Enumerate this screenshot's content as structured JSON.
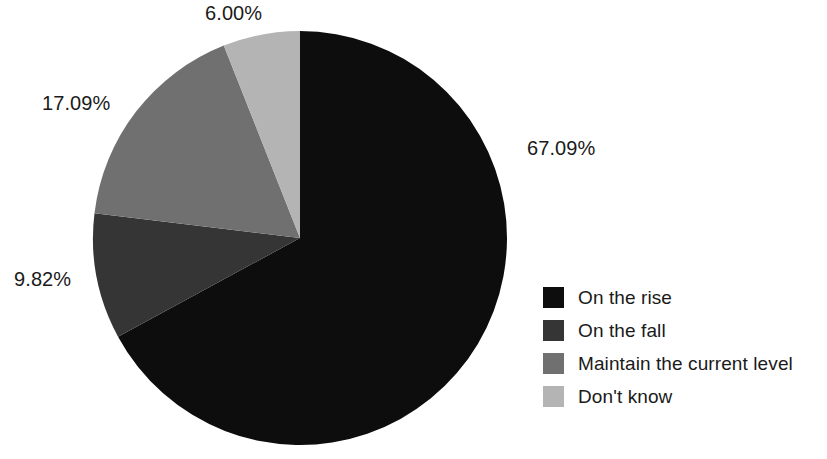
{
  "chart_data": {
    "type": "pie",
    "title": "",
    "labels": [
      "On the rise",
      "On the fall",
      "Maintain the current level",
      "Don't know"
    ],
    "values": [
      67.09,
      9.82,
      17.09,
      6.0
    ],
    "value_labels": [
      "67.09%",
      "9.82%",
      "17.09%",
      "6.00%"
    ],
    "colors": [
      "#0d0d0d",
      "#353535",
      "#707070",
      "#b4b4b4"
    ],
    "units": "percent",
    "start_angle_deg": 0,
    "direction": "clockwise",
    "legend_position": "bottom-right",
    "background": "#ffffff",
    "grid": false
  },
  "slice_labels": {
    "on_the_rise": "67.09%",
    "on_the_fall": "9.82%",
    "maintain": "17.09%",
    "dont_know": "6.00%"
  },
  "legend": {
    "items": [
      {
        "label": "On the rise",
        "color": "#0d0d0d"
      },
      {
        "label": "On the fall",
        "color": "#353535"
      },
      {
        "label": "Maintain the current level",
        "color": "#707070"
      },
      {
        "label": "Don't know",
        "color": "#b4b4b4"
      }
    ]
  }
}
